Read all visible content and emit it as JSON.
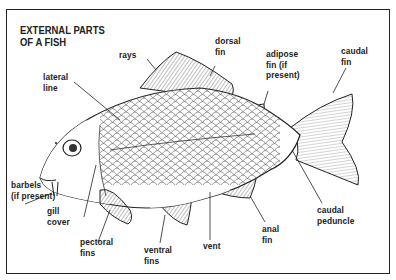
{
  "title": "EXTERNAL PARTS\nOF A FISH",
  "labels": {
    "rays": "rays",
    "dorsal_fin": "dorsal\nfin",
    "adipose_fin": "adipose\nfin (if\npresent)",
    "caudal_fin": "caudal\nfin",
    "lateral_line": "lateral\nline",
    "barbels": "barbels\n(if present)",
    "gill_cover": "gill\ncover",
    "pectoral_fins": "pectoral\nfins",
    "ventral_fins": "ventral\nfins",
    "vent": "vent",
    "anal_fin": "anal\nfin",
    "caudal_peduncle": "caudal\npeduncle"
  },
  "colors": {
    "ink": "#222222",
    "background": "#ffffff"
  }
}
